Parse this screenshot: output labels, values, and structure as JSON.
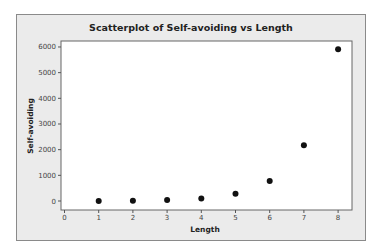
{
  "chart_data": {
    "type": "scatter",
    "title": "Scatterplot of Self-avoiding vs Length",
    "xlabel": "Length",
    "ylabel": "Self-avoiding",
    "x": [
      1,
      2,
      3,
      4,
      5,
      6,
      7,
      8
    ],
    "y": [
      4,
      12,
      36,
      100,
      284,
      780,
      2172,
      5916
    ],
    "xlim": [
      0,
      8
    ],
    "ylim": [
      0,
      6000
    ],
    "xticks": [
      0,
      1,
      2,
      3,
      4,
      5,
      6,
      7,
      8
    ],
    "yticks": [
      0,
      1000,
      2000,
      3000,
      4000,
      5000,
      6000
    ],
    "grid": false,
    "legend": null,
    "colors": {
      "background": "#ebebeb",
      "plot_area": "#ffffff",
      "marker": "#111111"
    }
  }
}
